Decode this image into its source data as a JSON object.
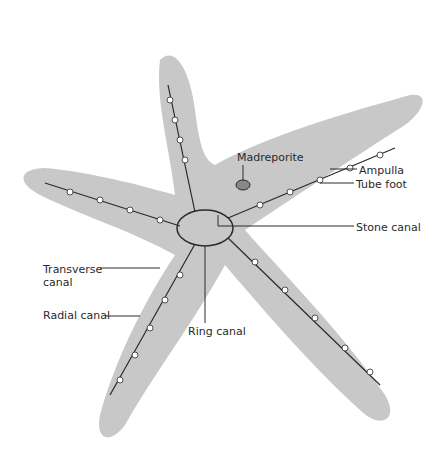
{
  "diagram": {
    "body_color": "#c8c8c8",
    "line_color": "#2a2a2a",
    "labels": [
      {
        "id": "madreporite",
        "text": "Madreporite",
        "x": 237,
        "y": 151
      },
      {
        "id": "ampulla",
        "text": "Ampulla",
        "x": 359,
        "y": 164
      },
      {
        "id": "tube-foot",
        "text": "Tube foot",
        "x": 356,
        "y": 178
      },
      {
        "id": "stone-canal",
        "text": "Stone canal",
        "x": 356,
        "y": 221
      },
      {
        "id": "transverse-canal",
        "text": "Transverse\ncanal",
        "x": 43,
        "y": 263
      },
      {
        "id": "radial-canal",
        "text": "Radial canal",
        "x": 43,
        "y": 309
      },
      {
        "id": "ring-canal",
        "text": "Ring canal",
        "x": 188,
        "y": 325
      }
    ]
  }
}
